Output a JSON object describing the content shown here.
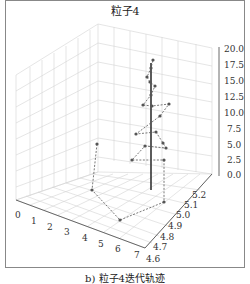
{
  "title": "粒子4",
  "caption": "b) 粒子4迭代轨迹",
  "chart_data": {
    "type": "scatter3d-line",
    "title": "粒子4",
    "caption": "b) 粒子4迭代轨迹",
    "x_axis": {
      "ticks": [
        "0",
        "1",
        "2",
        "3",
        "4",
        "5",
        "6",
        "7"
      ],
      "range": [
        0,
        7.5
      ]
    },
    "y_axis": {
      "ticks": [
        "4.6",
        "4.7",
        "4.8",
        "4.9",
        "5.0",
        "5.1",
        "5.2"
      ],
      "range": [
        4.6,
        5.25
      ]
    },
    "z_axis": {
      "ticks": [
        "0.0",
        "2.5",
        "5.0",
        "7.5",
        "10.0",
        "12.5",
        "15.0",
        "17.5",
        "20.0"
      ],
      "range": [
        0,
        20
      ]
    },
    "grid": true,
    "series": [
      {
        "name": "trajectory",
        "style": "dashed line with dot markers",
        "color": "#555555",
        "screen_points": [
          [
            97,
            144
          ],
          [
            92,
            190
          ],
          [
            120,
            220
          ],
          [
            164,
            202
          ],
          [
            164,
            160
          ],
          [
            132,
            160
          ],
          [
            145,
            146
          ],
          [
            166,
            148
          ],
          [
            163,
            143
          ],
          [
            156,
            132
          ],
          [
            136,
            134
          ],
          [
            160,
            116
          ],
          [
            169,
            104
          ],
          [
            152,
            106
          ],
          [
            143,
            105
          ],
          [
            151,
            95
          ],
          [
            155,
            86
          ],
          [
            150,
            82
          ],
          [
            147,
            77
          ],
          [
            151,
            68
          ],
          [
            153,
            60
          ]
        ]
      },
      {
        "name": "final-position-vertical",
        "style": "solid line",
        "color": "#333333",
        "screen_points": [
          [
            151,
            63
          ],
          [
            151,
            190
          ]
        ]
      }
    ]
  }
}
